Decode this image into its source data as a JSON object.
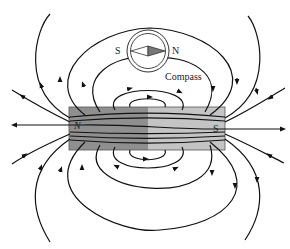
{
  "figure": {
    "magnet": {
      "north_label": "N",
      "south_label": "S",
      "north_color": "#8a8a8a",
      "south_color": "#bdbdbd"
    },
    "compass": {
      "south_label": "S",
      "north_label": "N",
      "caption": "Compass"
    }
  }
}
